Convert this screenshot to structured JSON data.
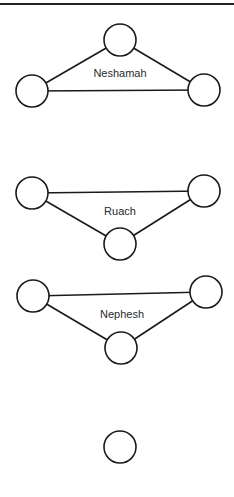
{
  "diagram": {
    "width": 234,
    "height": 497,
    "colors": {
      "stroke": "#1a1a1a",
      "fill": "#ffffff",
      "text": "#2a2a2a",
      "rule": "#222222"
    },
    "top_rule": {
      "x1": 0,
      "x2": 234,
      "y": 4
    },
    "node_radius": 16,
    "groups": [
      {
        "label": "Neshamah",
        "label_pos": {
          "x": 120,
          "y": 77
        },
        "nodes": [
          {
            "id": "top",
            "x": 120,
            "y": 40
          },
          {
            "id": "left",
            "x": 32,
            "y": 91
          },
          {
            "id": "right",
            "x": 204,
            "y": 90
          }
        ],
        "edges": [
          [
            "left",
            "top"
          ],
          [
            "top",
            "right"
          ],
          [
            "left",
            "right"
          ]
        ]
      },
      {
        "label": "Ruach",
        "label_pos": {
          "x": 120,
          "y": 215
        },
        "nodes": [
          {
            "id": "left",
            "x": 32,
            "y": 193
          },
          {
            "id": "right",
            "x": 204,
            "y": 191
          },
          {
            "id": "bottom",
            "x": 120,
            "y": 244
          }
        ],
        "edges": [
          [
            "left",
            "right"
          ],
          [
            "left",
            "bottom"
          ],
          [
            "bottom",
            "right"
          ]
        ]
      },
      {
        "label": "Nephesh",
        "label_pos": {
          "x": 122,
          "y": 318
        },
        "nodes": [
          {
            "id": "left",
            "x": 33,
            "y": 296
          },
          {
            "id": "right",
            "x": 206,
            "y": 292
          },
          {
            "id": "bottom",
            "x": 121,
            "y": 348
          }
        ],
        "edges": [
          [
            "left",
            "right"
          ],
          [
            "left",
            "bottom"
          ],
          [
            "bottom",
            "right"
          ]
        ]
      },
      {
        "label": "",
        "nodes": [
          {
            "id": "single",
            "x": 120,
            "y": 447
          }
        ],
        "edges": []
      }
    ]
  }
}
